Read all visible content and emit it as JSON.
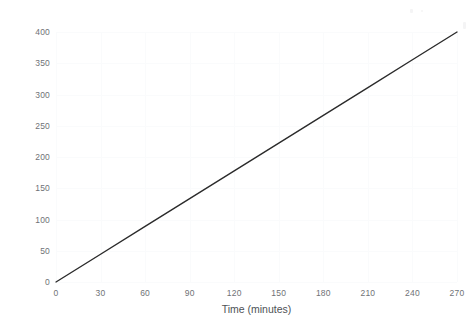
{
  "chart_data": {
    "type": "line",
    "title": "",
    "xlabel": "Time (minutes)",
    "ylabel": "Cost (£)",
    "xlim": [
      0,
      270
    ],
    "ylim": [
      0,
      400
    ],
    "xticks": [
      0,
      30,
      60,
      90,
      120,
      150,
      180,
      210,
      240,
      270
    ],
    "xtick_labels": [
      "0",
      "30",
      "60",
      "90",
      "120",
      "150",
      "180",
      "210",
      "240",
      "270"
    ],
    "yticks": [
      0,
      50,
      100,
      150,
      200,
      250,
      300,
      350,
      400
    ],
    "ytick_labels": [
      "0",
      "50",
      "100",
      "150",
      "200",
      "250",
      "300",
      "350",
      "400"
    ],
    "grid": true,
    "legend": null,
    "series": [
      {
        "name": "Cost",
        "color": "#2b2b2b",
        "linewidth": 1.4,
        "x": [
          0,
          30,
          60,
          90,
          120,
          150,
          180,
          210,
          240,
          270
        ],
        "values": [
          0,
          44.4,
          88.9,
          133.3,
          177.8,
          222.2,
          266.7,
          311.1,
          355.6,
          400
        ]
      }
    ],
    "annotations": []
  },
  "style": {
    "background": "#ffffff",
    "grid_color": "#fafbfc",
    "tick_label_color": "#6f7276",
    "axis_label_color": "#4e5256",
    "line_color": "#2b2b2b"
  }
}
